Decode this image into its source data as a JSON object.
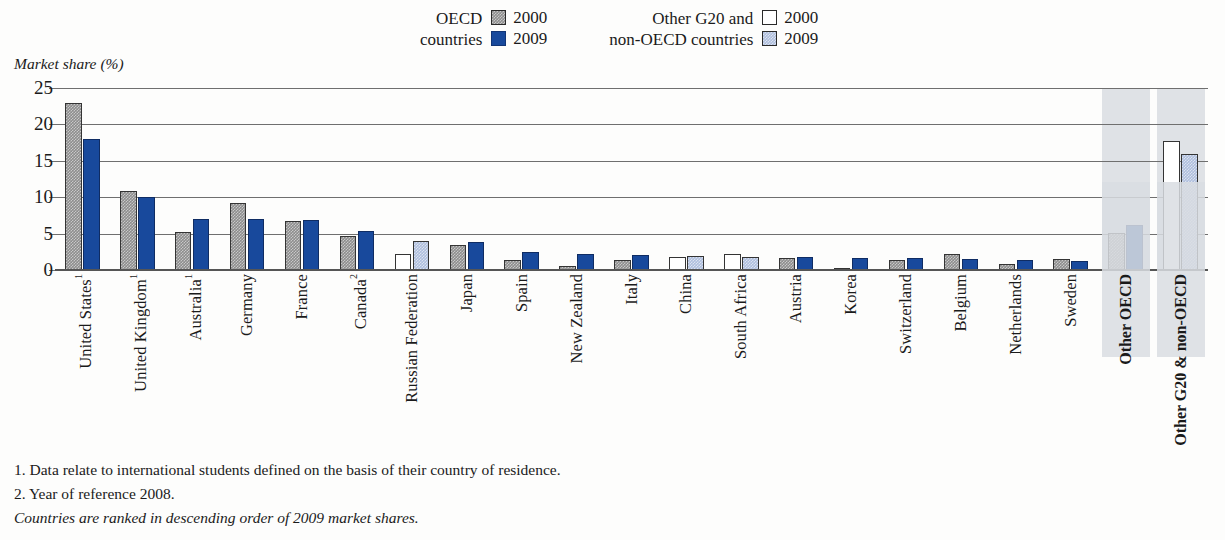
{
  "axis_title": "Market share (%)",
  "legend": {
    "groups": [
      {
        "label_line1": "OECD",
        "label_line2": "countries",
        "keys": [
          {
            "year": "2000",
            "swatch": "grey-hatch-swatch",
            "color": "#8d8d8d"
          },
          {
            "year": "2009",
            "swatch": "solid-blue-swatch",
            "color": "#18499c"
          }
        ]
      },
      {
        "label_line1": "Other G20 and",
        "label_line2": "non-OECD countries",
        "keys": [
          {
            "year": "2000",
            "swatch": "white-swatch",
            "color": "#ffffff"
          },
          {
            "year": "2009",
            "swatch": "light-blue-hatch-swatch",
            "color": "#aebedd"
          }
        ]
      }
    ]
  },
  "notes": [
    "1. Data relate to international students defined on the basis of their country of residence.",
    "2. Year of reference 2008.",
    "Countries are ranked in descending order of 2009 market shares."
  ],
  "chart_data": {
    "type": "bar",
    "title": "",
    "xlabel": "",
    "ylabel": "Market share (%)",
    "ylim": [
      0,
      25
    ],
    "yticks": [
      "0",
      "5",
      "10",
      "15",
      "20",
      "25"
    ],
    "grid": true,
    "legend_position": "top",
    "series": [
      {
        "name": "2000",
        "group": "OECD countries",
        "color": "#8d8d8d"
      },
      {
        "name": "2009",
        "group": "OECD countries",
        "color": "#18499c"
      },
      {
        "name": "2000",
        "group": "Other G20 and non-OECD countries",
        "color": "#ffffff"
      },
      {
        "name": "2009",
        "group": "Other G20 and non-OECD countries",
        "color": "#aebedd"
      }
    ],
    "categories": [
      "United States",
      "United Kingdom",
      "Australia",
      "Germany",
      "France",
      "Canada",
      "Russian Federation",
      "Japan",
      "Spain",
      "New Zealand",
      "Italy",
      "China",
      "South Africa",
      "Austria",
      "Korea",
      "Switzerland",
      "Belgium",
      "Netherlands",
      "Sweden",
      "Other OECD",
      "Other G20 & non-OECD"
    ],
    "points": [
      {
        "label": "United States",
        "footnote": "1",
        "group": "oecd",
        "v2000": 23.0,
        "v2009": 18.0,
        "highlight": false,
        "bold": false
      },
      {
        "label": "United Kingdom",
        "footnote": "1",
        "group": "oecd",
        "v2000": 10.8,
        "v2009": 10.0,
        "highlight": false,
        "bold": false
      },
      {
        "label": "Australia",
        "footnote": "1",
        "group": "oecd",
        "v2000": 5.2,
        "v2009": 7.0,
        "highlight": false,
        "bold": false
      },
      {
        "label": "Germany",
        "footnote": "",
        "group": "oecd",
        "v2000": 9.2,
        "v2009": 7.0,
        "highlight": false,
        "bold": false
      },
      {
        "label": "France",
        "footnote": "",
        "group": "oecd",
        "v2000": 6.7,
        "v2009": 6.9,
        "highlight": false,
        "bold": false
      },
      {
        "label": "Canada",
        "footnote": "2",
        "group": "oecd",
        "v2000": 4.7,
        "v2009": 5.3,
        "highlight": false,
        "bold": false
      },
      {
        "label": "Russian Federation",
        "footnote": "",
        "group": "non-oecd",
        "v2000": 2.2,
        "v2009": 4.0,
        "highlight": false,
        "bold": false
      },
      {
        "label": "Japan",
        "footnote": "",
        "group": "oecd",
        "v2000": 3.4,
        "v2009": 3.8,
        "highlight": false,
        "bold": false
      },
      {
        "label": "Spain",
        "footnote": "",
        "group": "oecd",
        "v2000": 1.4,
        "v2009": 2.5,
        "highlight": false,
        "bold": false
      },
      {
        "label": "New Zealand",
        "footnote": "",
        "group": "oecd",
        "v2000": 0.6,
        "v2009": 2.2,
        "highlight": false,
        "bold": false
      },
      {
        "label": "Italy",
        "footnote": "",
        "group": "oecd",
        "v2000": 1.4,
        "v2009": 2.0,
        "highlight": false,
        "bold": false
      },
      {
        "label": "China",
        "footnote": "",
        "group": "non-oecd",
        "v2000": 1.8,
        "v2009": 1.9,
        "highlight": false,
        "bold": false
      },
      {
        "label": "South Africa",
        "footnote": "",
        "group": "non-oecd",
        "v2000": 2.2,
        "v2009": 1.8,
        "highlight": false,
        "bold": false
      },
      {
        "label": "Austria",
        "footnote": "",
        "group": "oecd",
        "v2000": 1.6,
        "v2009": 1.8,
        "highlight": false,
        "bold": false
      },
      {
        "label": "Korea",
        "footnote": "",
        "group": "oecd",
        "v2000": 0.15,
        "v2009": 1.6,
        "highlight": false,
        "bold": false
      },
      {
        "label": "Switzerland",
        "footnote": "",
        "group": "oecd",
        "v2000": 1.4,
        "v2009": 1.6,
        "highlight": false,
        "bold": false
      },
      {
        "label": "Belgium",
        "footnote": "",
        "group": "oecd",
        "v2000": 2.2,
        "v2009": 1.5,
        "highlight": false,
        "bold": false
      },
      {
        "label": "Netherlands",
        "footnote": "",
        "group": "oecd",
        "v2000": 0.8,
        "v2009": 1.4,
        "highlight": false,
        "bold": false
      },
      {
        "label": "Sweden",
        "footnote": "",
        "group": "oecd",
        "v2000": 1.5,
        "v2009": 1.3,
        "highlight": false,
        "bold": false
      },
      {
        "label": "Other OECD",
        "footnote": "",
        "group": "oecd",
        "v2000": 5.1,
        "v2009": 6.2,
        "highlight": true,
        "bold": true
      },
      {
        "label": "Other G20 & non-OECD",
        "footnote": "",
        "group": "non-oecd",
        "v2000": 17.7,
        "v2009": 16.0,
        "highlight": true,
        "bold": true
      }
    ]
  }
}
